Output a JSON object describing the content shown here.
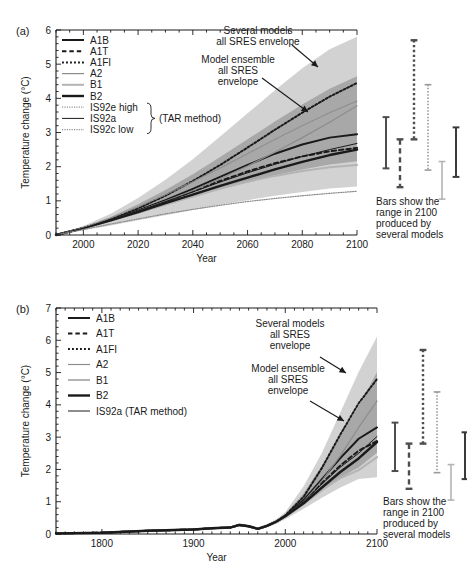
{
  "figure": {
    "background_color": "#ffffff",
    "envelope_outer_color": "#d2d2d2",
    "envelope_inner_color": "#a8a8a8",
    "line_color": "#1a1a1a",
    "gray_line_color": "#8c8c8c",
    "light_gray_line_color": "#b4b4b4"
  },
  "panels": [
    {
      "id": "a",
      "label": "(a)",
      "ylabel": "Temperature change (°C)",
      "xlabel": "Year",
      "ylim": [
        0,
        6
      ],
      "yticks": [
        0,
        1,
        2,
        3,
        4,
        5,
        6
      ],
      "ytick_labels": [
        "0",
        "1",
        "2",
        "3",
        "4",
        "5",
        "6"
      ],
      "xlim": [
        1990,
        2100
      ],
      "xticks": [
        2000,
        2020,
        2040,
        2060,
        2080,
        2100
      ],
      "xtick_labels": [
        "2000",
        "2020",
        "2040",
        "2060",
        "2080",
        "2100"
      ],
      "legend": [
        {
          "label": "A1B",
          "style": "solid",
          "color": "#1a1a1a",
          "width": 2.0
        },
        {
          "label": "A1T",
          "style": "dashed",
          "color": "#1a1a1a",
          "width": 2.0
        },
        {
          "label": "A1FI",
          "style": "dotted",
          "color": "#1a1a1a",
          "width": 2.0
        },
        {
          "label": "A2",
          "style": "solid",
          "color": "#8c8c8c",
          "width": 1.2
        },
        {
          "label": "B1",
          "style": "solid",
          "color": "#b4b4b4",
          "width": 2.0
        },
        {
          "label": "B2",
          "style": "solid",
          "color": "#1a1a1a",
          "width": 2.4
        },
        {
          "label": "IS92e high",
          "style": "dotted",
          "color": "#8c8c8c",
          "width": 1.2
        },
        {
          "label": "IS92a",
          "style": "solid",
          "color": "#1a1a1a",
          "width": 1.0
        },
        {
          "label": "IS92c low",
          "style": "dotted",
          "color": "#8c8c8c",
          "width": 1.2
        }
      ],
      "legend_bracket_label": "(TAR method)",
      "annotations": [
        {
          "id": "several-models",
          "lines": [
            "Several models",
            "all SRES envelope"
          ]
        },
        {
          "id": "model-ensemble",
          "lines": [
            "Model ensemble",
            "all SRES",
            "envelope"
          ]
        }
      ],
      "bars_note": [
        "Bars show the",
        "range in 2100",
        "produced by",
        "several models"
      ],
      "bars": [
        {
          "name": "A1B",
          "low": 1.95,
          "high": 3.45,
          "style": "solid",
          "color": "#4d4d4d",
          "width": 2.0
        },
        {
          "name": "A1T",
          "low": 1.4,
          "high": 2.8,
          "style": "dashed",
          "color": "#4d4d4d",
          "width": 2.4
        },
        {
          "name": "A1FI",
          "low": 2.8,
          "high": 5.7,
          "style": "dotted",
          "color": "#4d4d4d",
          "width": 2.4
        },
        {
          "name": "A2",
          "low": 1.9,
          "high": 4.4,
          "style": "dotted",
          "color": "#9a9a9a",
          "width": 1.6
        },
        {
          "name": "B1",
          "low": 1.05,
          "high": 2.15,
          "style": "solid",
          "color": "#b4b4b4",
          "width": 1.6
        },
        {
          "name": "B2",
          "low": 1.7,
          "high": 3.15,
          "style": "solid",
          "color": "#3a3a3a",
          "width": 2.0
        }
      ]
    },
    {
      "id": "b",
      "label": "(b)",
      "ylabel": "Temperature change (°C)",
      "xlabel": "Year",
      "ylim": [
        0,
        7
      ],
      "yticks": [
        0,
        1,
        2,
        3,
        4,
        5,
        6,
        7
      ],
      "ytick_labels": [
        "0",
        "1",
        "2",
        "3",
        "4",
        "5",
        "6",
        "7"
      ],
      "xlim": [
        1750,
        2100
      ],
      "xticks": [
        1800,
        1900,
        2000,
        2100
      ],
      "xtick_labels": [
        "1800",
        "1900",
        "2000",
        "2100"
      ],
      "legend": [
        {
          "label": "A1B",
          "style": "solid",
          "color": "#1a1a1a",
          "width": 2.0
        },
        {
          "label": "A1T",
          "style": "dashed",
          "color": "#1a1a1a",
          "width": 2.0
        },
        {
          "label": "A1FI",
          "style": "dotted",
          "color": "#1a1a1a",
          "width": 2.0
        },
        {
          "label": "A2",
          "style": "solid",
          "color": "#8c8c8c",
          "width": 1.2
        },
        {
          "label": "B1",
          "style": "solid",
          "color": "#b4b4b4",
          "width": 2.0
        },
        {
          "label": "B2",
          "style": "solid",
          "color": "#1a1a1a",
          "width": 2.4
        },
        {
          "label": "IS92a (TAR method)",
          "style": "solid",
          "color": "#1a1a1a",
          "width": 1.0
        }
      ],
      "annotations": [
        {
          "id": "several-models",
          "lines": [
            "Several models",
            "all SRES",
            "envelope"
          ]
        },
        {
          "id": "model-ensemble",
          "lines": [
            "Model ensemble",
            "all SRES",
            "envelope"
          ]
        }
      ],
      "bars_note": [
        "Bars show the",
        "range in 2100",
        "produced by",
        "several models"
      ],
      "bars": [
        {
          "name": "A1B",
          "low": 1.95,
          "high": 3.45,
          "style": "solid",
          "color": "#4d4d4d",
          "width": 2.0
        },
        {
          "name": "A1T",
          "low": 1.4,
          "high": 2.8,
          "style": "dashed",
          "color": "#4d4d4d",
          "width": 2.4
        },
        {
          "name": "A1FI",
          "low": 2.8,
          "high": 5.7,
          "style": "dotted",
          "color": "#4d4d4d",
          "width": 2.4
        },
        {
          "name": "A2",
          "low": 1.9,
          "high": 4.4,
          "style": "dotted",
          "color": "#9a9a9a",
          "width": 1.6
        },
        {
          "name": "B1",
          "low": 1.05,
          "high": 2.15,
          "style": "solid",
          "color": "#b4b4b4",
          "width": 1.6
        },
        {
          "name": "B2",
          "low": 1.7,
          "high": 3.15,
          "style": "solid",
          "color": "#3a3a3a",
          "width": 2.0
        }
      ]
    }
  ],
  "chart_data": [
    {
      "id": "panel-a",
      "type": "line",
      "title": "",
      "xlabel": "Year",
      "ylabel": "Temperature change (°C)",
      "xlim": [
        1990,
        2100
      ],
      "ylim": [
        0,
        6
      ],
      "xticks": [
        2000,
        2020,
        2040,
        2060,
        2080,
        2100
      ],
      "yticks": [
        0,
        1,
        2,
        3,
        4,
        5,
        6
      ],
      "grid": false,
      "legend_position": "upper-left",
      "x": [
        1990,
        2000,
        2010,
        2020,
        2030,
        2040,
        2050,
        2060,
        2070,
        2080,
        2090,
        2100
      ],
      "series": [
        {
          "name": "A1B",
          "values": [
            0.0,
            0.2,
            0.45,
            0.72,
            1.02,
            1.35,
            1.7,
            2.05,
            2.38,
            2.65,
            2.85,
            2.95
          ]
        },
        {
          "name": "A1T",
          "values": [
            0.0,
            0.2,
            0.44,
            0.7,
            0.98,
            1.28,
            1.58,
            1.86,
            2.1,
            2.3,
            2.45,
            2.55
          ]
        },
        {
          "name": "A1FI",
          "values": [
            0.0,
            0.2,
            0.46,
            0.78,
            1.15,
            1.58,
            2.05,
            2.56,
            3.08,
            3.58,
            4.05,
            4.45
          ]
        },
        {
          "name": "A2",
          "values": [
            0.0,
            0.2,
            0.44,
            0.7,
            0.99,
            1.3,
            1.65,
            2.02,
            2.42,
            2.85,
            3.3,
            3.78
          ]
        },
        {
          "name": "B1",
          "values": [
            0.0,
            0.2,
            0.42,
            0.66,
            0.9,
            1.14,
            1.36,
            1.56,
            1.73,
            1.87,
            1.98,
            2.05
          ]
        },
        {
          "name": "B2",
          "values": [
            0.0,
            0.2,
            0.43,
            0.67,
            0.93,
            1.18,
            1.44,
            1.68,
            1.92,
            2.14,
            2.34,
            2.5
          ]
        },
        {
          "name": "IS92e high",
          "values": [
            0.0,
            0.22,
            0.5,
            0.82,
            1.18,
            1.56,
            1.96,
            2.38,
            2.8,
            3.2,
            3.58,
            3.92
          ]
        },
        {
          "name": "IS92a",
          "values": [
            0.0,
            0.2,
            0.44,
            0.7,
            0.98,
            1.26,
            1.55,
            1.82,
            2.07,
            2.3,
            2.5,
            2.68
          ]
        },
        {
          "name": "IS92c low",
          "values": [
            0.0,
            0.16,
            0.32,
            0.47,
            0.62,
            0.75,
            0.87,
            0.98,
            1.07,
            1.15,
            1.22,
            1.28
          ]
        }
      ],
      "bands": [
        {
          "name": "Several models all SRES envelope",
          "color": "#d2d2d2",
          "lower": [
            0.0,
            0.14,
            0.28,
            0.43,
            0.58,
            0.73,
            0.88,
            1.02,
            1.15,
            1.26,
            1.36,
            1.42
          ],
          "upper": [
            0.0,
            0.26,
            0.62,
            1.08,
            1.62,
            2.22,
            2.88,
            3.56,
            4.24,
            4.88,
            5.44,
            5.8
          ]
        },
        {
          "name": "Model ensemble all SRES envelope",
          "color": "#a8a8a8",
          "lower": [
            0.0,
            0.18,
            0.4,
            0.62,
            0.86,
            1.1,
            1.33,
            1.55,
            1.75,
            1.92,
            2.06,
            2.16
          ],
          "upper": [
            0.0,
            0.23,
            0.53,
            0.9,
            1.32,
            1.78,
            2.28,
            2.8,
            3.32,
            3.82,
            4.28,
            4.65
          ]
        }
      ],
      "range_bars_2100": [
        {
          "name": "A1B",
          "low": 1.95,
          "high": 3.45
        },
        {
          "name": "A1T",
          "low": 1.4,
          "high": 2.8
        },
        {
          "name": "A1FI",
          "low": 2.8,
          "high": 5.7
        },
        {
          "name": "A2",
          "low": 1.9,
          "high": 4.4
        },
        {
          "name": "B1",
          "low": 1.05,
          "high": 2.15
        },
        {
          "name": "B2",
          "low": 1.7,
          "high": 3.15
        }
      ]
    },
    {
      "id": "panel-b",
      "type": "line",
      "title": "",
      "xlabel": "Year",
      "ylabel": "Temperature change (°C)",
      "xlim": [
        1750,
        2100
      ],
      "ylim": [
        0,
        7
      ],
      "xticks": [
        1800,
        1900,
        2000,
        2100
      ],
      "yticks": [
        0,
        1,
        2,
        3,
        4,
        5,
        6,
        7
      ],
      "grid": false,
      "legend_position": "upper-left",
      "x": [
        1750,
        1800,
        1850,
        1900,
        1920,
        1940,
        1950,
        1960,
        1970,
        1980,
        1990,
        2000,
        2020,
        2040,
        2060,
        2080,
        2100
      ],
      "series": [
        {
          "name": "A1B",
          "values": [
            0.02,
            0.04,
            0.1,
            0.14,
            0.18,
            0.2,
            0.28,
            0.24,
            0.16,
            0.25,
            0.38,
            0.55,
            1.05,
            1.7,
            2.35,
            2.95,
            3.3
          ]
        },
        {
          "name": "A1T",
          "values": [
            0.02,
            0.04,
            0.1,
            0.14,
            0.18,
            0.2,
            0.28,
            0.24,
            0.16,
            0.25,
            0.38,
            0.55,
            1.02,
            1.58,
            2.12,
            2.58,
            2.88
          ]
        },
        {
          "name": "A1FI",
          "values": [
            0.02,
            0.04,
            0.1,
            0.14,
            0.18,
            0.2,
            0.28,
            0.24,
            0.16,
            0.25,
            0.38,
            0.58,
            1.15,
            2.05,
            3.08,
            4.05,
            4.8
          ]
        },
        {
          "name": "A2",
          "values": [
            0.02,
            0.04,
            0.1,
            0.14,
            0.18,
            0.2,
            0.28,
            0.24,
            0.16,
            0.25,
            0.38,
            0.55,
            1.0,
            1.65,
            2.42,
            3.3,
            4.12
          ]
        },
        {
          "name": "B1",
          "values": [
            0.02,
            0.04,
            0.1,
            0.14,
            0.18,
            0.2,
            0.28,
            0.24,
            0.16,
            0.25,
            0.38,
            0.54,
            0.92,
            1.36,
            1.73,
            1.98,
            2.38
          ]
        },
        {
          "name": "B2",
          "values": [
            0.02,
            0.04,
            0.1,
            0.14,
            0.18,
            0.2,
            0.28,
            0.24,
            0.16,
            0.25,
            0.38,
            0.55,
            0.95,
            1.44,
            1.92,
            2.34,
            2.85
          ]
        },
        {
          "name": "IS92a (TAR method)",
          "values": [
            0.02,
            0.04,
            0.1,
            0.14,
            0.18,
            0.2,
            0.28,
            0.24,
            0.16,
            0.25,
            0.38,
            0.55,
            1.0,
            1.55,
            2.07,
            2.5,
            3.02
          ]
        }
      ],
      "bands": [
        {
          "name": "Several models all SRES envelope",
          "color": "#d2d2d2",
          "lower": [
            0.0,
            0.02,
            0.07,
            0.11,
            0.15,
            0.17,
            0.24,
            0.2,
            0.12,
            0.2,
            0.31,
            0.46,
            0.78,
            1.12,
            1.44,
            1.7,
            1.76
          ],
          "upper": [
            0.04,
            0.07,
            0.14,
            0.18,
            0.22,
            0.24,
            0.33,
            0.29,
            0.21,
            0.31,
            0.46,
            0.68,
            1.48,
            2.52,
            3.76,
            5.02,
            6.12
          ]
        },
        {
          "name": "Model ensemble all SRES envelope",
          "color": "#a8a8a8",
          "lower": [
            0.01,
            0.03,
            0.09,
            0.13,
            0.17,
            0.19,
            0.26,
            0.22,
            0.15,
            0.23,
            0.35,
            0.51,
            0.92,
            1.33,
            1.75,
            2.06,
            2.52
          ],
          "upper": [
            0.03,
            0.06,
            0.12,
            0.16,
            0.2,
            0.22,
            0.31,
            0.27,
            0.18,
            0.28,
            0.42,
            0.62,
            1.26,
            2.12,
            3.04,
            3.96,
            5.02
          ]
        }
      ],
      "range_bars_2100": [
        {
          "name": "A1B",
          "low": 1.95,
          "high": 3.45
        },
        {
          "name": "A1T",
          "low": 1.4,
          "high": 2.8
        },
        {
          "name": "A1FI",
          "low": 2.8,
          "high": 5.7
        },
        {
          "name": "A2",
          "low": 1.9,
          "high": 4.4
        },
        {
          "name": "B1",
          "low": 1.05,
          "high": 2.15
        },
        {
          "name": "B2",
          "low": 1.7,
          "high": 3.15
        }
      ]
    }
  ]
}
